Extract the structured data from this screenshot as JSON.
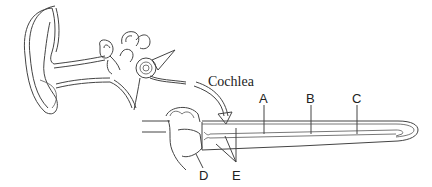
{
  "diagram": {
    "type": "anatomy",
    "caption_label": "Cochlea",
    "labels": [
      {
        "id": "A",
        "text": "A"
      },
      {
        "id": "B",
        "text": "B"
      },
      {
        "id": "C",
        "text": "C"
      },
      {
        "id": "D",
        "text": "D"
      },
      {
        "id": "E",
        "text": "E"
      }
    ]
  }
}
